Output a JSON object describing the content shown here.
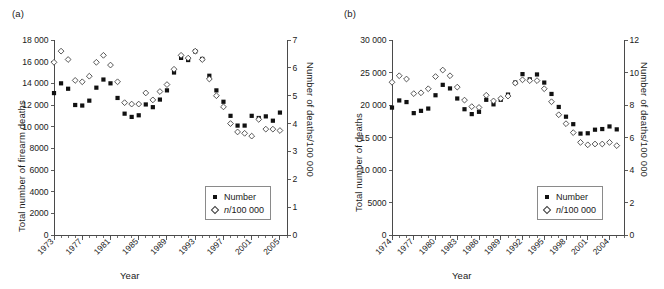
{
  "figure": {
    "panels": [
      {
        "id": "a",
        "label": "(a)",
        "chart_data": {
          "type": "scatter",
          "title": "",
          "xlabel": "Year",
          "ylabel": "Total number of firearm deaths",
          "y2label": "Number of deaths/100 000",
          "xlim": [
            1973,
            2006
          ],
          "ylim": [
            0,
            18000
          ],
          "y2lim": [
            0,
            7
          ],
          "yticks": [
            0,
            2000,
            4000,
            6000,
            8000,
            10000,
            12000,
            14000,
            16000,
            18000
          ],
          "ytick_labels": [
            "0",
            "2000",
            "4000",
            "6000",
            "8000",
            "10 000",
            "12 000",
            "14 000",
            "16 000",
            "18 000"
          ],
          "y2ticks": [
            0,
            1,
            2,
            3,
            4,
            5,
            6,
            7
          ],
          "y2tick_labels": [
            "0",
            "1",
            "2",
            "3",
            "4",
            "5",
            "6",
            "7"
          ],
          "xticks": [
            1973,
            1977,
            1981,
            1985,
            1989,
            1993,
            1997,
            2001,
            2005
          ],
          "xtick_labels": [
            "1973",
            "1977",
            "1981",
            "1985",
            "1989",
            "1993",
            "1997",
            "2001",
            "2005"
          ],
          "grid": false,
          "legend_position": "lower right",
          "x": [
            1973,
            1974,
            1975,
            1976,
            1977,
            1978,
            1979,
            1980,
            1981,
            1982,
            1983,
            1984,
            1985,
            1986,
            1987,
            1988,
            1989,
            1990,
            1991,
            1992,
            1993,
            1994,
            1995,
            1996,
            1997,
            1998,
            1999,
            2000,
            2001,
            2002,
            2003,
            2004,
            2005
          ],
          "series": [
            {
              "name": "Number",
              "marker": "filled-square",
              "axis": "left",
              "values": [
                13100,
                14000,
                13500,
                12000,
                11950,
                12400,
                13600,
                14350,
                14000,
                12650,
                11200,
                10900,
                11050,
                12050,
                11800,
                12500,
                13350,
                15000,
                16350,
                16150,
                16950,
                16250,
                14700,
                13350,
                12300,
                11000,
                10100,
                10100,
                11000,
                10800,
                10950,
                10550,
                11300
              ]
            },
            {
              "name": "n/100 000",
              "marker": "open-diamond",
              "axis": "right",
              "values": [
                6.2,
                6.6,
                6.3,
                5.55,
                5.5,
                5.7,
                6.2,
                6.45,
                6.1,
                5.5,
                4.75,
                4.7,
                4.7,
                5.1,
                4.85,
                5.15,
                5.4,
                5.95,
                6.45,
                6.35,
                6.6,
                6.3,
                5.6,
                5.0,
                4.6,
                4.0,
                3.7,
                3.65,
                3.55,
                4.15,
                3.8,
                3.8,
                3.75
              ]
            }
          ]
        },
        "legend": [
          {
            "label": "Number",
            "marker": "filled-square"
          },
          {
            "label": "n/100 000",
            "marker": "open-diamond",
            "italic_prefix": "n"
          }
        ]
      },
      {
        "id": "b",
        "label": "(b)",
        "chart_data": {
          "type": "scatter",
          "title": "",
          "xlabel": "Year",
          "ylabel": "Total number of deaths",
          "y2label": "Number of deaths/100 000",
          "xlim": [
            1974,
            2006
          ],
          "ylim": [
            0,
            30000
          ],
          "y2lim": [
            0,
            12
          ],
          "yticks": [
            0,
            5000,
            10000,
            15000,
            20000,
            25000,
            30000
          ],
          "ytick_labels": [
            "0",
            "5000",
            "10 000",
            "15 000",
            "20 000",
            "25 000",
            "30 000"
          ],
          "y2ticks": [
            0,
            2,
            4,
            6,
            8,
            10,
            12
          ],
          "y2tick_labels": [
            "0",
            "2",
            "4",
            "6",
            "8",
            "10",
            "12"
          ],
          "xticks": [
            1974,
            1977,
            1980,
            1983,
            1986,
            1989,
            1992,
            1995,
            1998,
            2001,
            2004
          ],
          "xtick_labels": [
            "1974",
            "1977",
            "1980",
            "1983",
            "1986",
            "1989",
            "1992",
            "1995",
            "1998",
            "2001",
            "2004"
          ],
          "grid": false,
          "legend_position": "lower right",
          "x": [
            1974,
            1975,
            1976,
            1977,
            1978,
            1979,
            1980,
            1981,
            1982,
            1983,
            1984,
            1985,
            1986,
            1987,
            1988,
            1989,
            1990,
            1991,
            1992,
            1993,
            1994,
            1995,
            1996,
            1997,
            1998,
            1999,
            2000,
            2001,
            2002,
            2003,
            2004,
            2005
          ],
          "series": [
            {
              "name": "Number",
              "marker": "filled-square",
              "axis": "left",
              "values": [
                19600,
                20700,
                20450,
                18750,
                19100,
                19450,
                21500,
                23100,
                22550,
                21000,
                19350,
                18600,
                18950,
                20800,
                20100,
                20800,
                21600,
                23450,
                24750,
                23950,
                24700,
                23450,
                21700,
                19700,
                18200,
                17050,
                15600,
                15650,
                16200,
                16300,
                16700,
                16250
              ]
            },
            {
              "name": "n/100 000",
              "marker": "open-diamond",
              "axis": "right",
              "values": [
                9.4,
                9.8,
                9.6,
                8.7,
                8.75,
                9.0,
                9.75,
                10.15,
                9.8,
                9.1,
                8.3,
                7.9,
                7.85,
                8.6,
                8.25,
                8.4,
                8.55,
                9.35,
                9.55,
                9.5,
                9.5,
                9.0,
                8.2,
                7.4,
                6.85,
                6.3,
                5.7,
                5.55,
                5.6,
                5.6,
                5.7,
                5.5
              ]
            }
          ]
        },
        "legend": [
          {
            "label": "Number",
            "marker": "filled-square"
          },
          {
            "label": "n/100 000",
            "marker": "open-diamond",
            "italic_prefix": "n"
          }
        ]
      }
    ]
  }
}
